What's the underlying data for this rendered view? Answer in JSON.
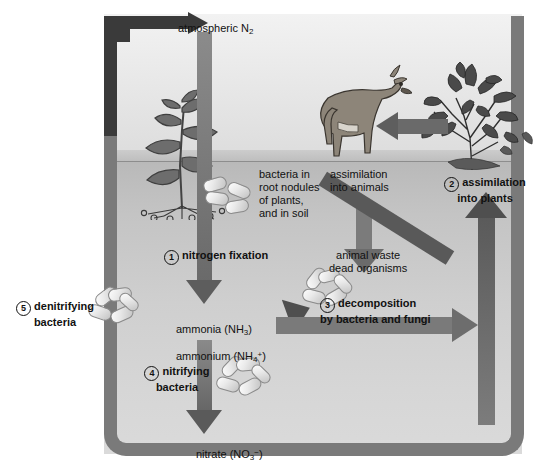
{
  "diagram": {
    "colors": {
      "loop_arrow": "#7a7a7a",
      "top_arrow": "#3a3a3a",
      "sky": "#e8e8e8",
      "soil": "#c9c9c9",
      "text": "#111111"
    }
  },
  "labels": {
    "atmospheric_n2": "atmospheric N",
    "atmospheric_n2_sub": "2",
    "bacteria_root_nodules": "bacteria in\nroot nodules\nof plants,\nand in soil",
    "assimilation_into_animals": "assimilation\ninto animals",
    "assimilation_into_plants": "assimilation\ninto plants",
    "assimilation_into_plants_num": "2",
    "nitrogen_fixation": "nitrogen fixation",
    "nitrogen_fixation_num": "1",
    "animal_waste_dead_organisms": "animal waste\ndead organisms",
    "denitrifying_bacteria": "denitrifying\nbacteria",
    "denitrifying_bacteria_num": "5",
    "ammonia": "ammonia (NH",
    "ammonia_sub": "3",
    "ammonia_close": ")",
    "ammonium": "ammonium (NH",
    "ammonium_sub": "4",
    "ammonium_sup": "+",
    "ammonium_close": ")",
    "decomposition": "decomposition\nby bacteria and fungi",
    "decomposition_num": "3",
    "nitrifying_bacteria": "nitrifying\nbacteria",
    "nitrifying_bacteria_num": "4",
    "nitrate": "nitrate (NO",
    "nitrate_sub": "3",
    "nitrate_sup": "−",
    "nitrate_close": ")"
  },
  "icons": {
    "legume_plant": "legume-plant-with-root-nodules-icon",
    "deer": "deer-icon",
    "shrub": "shrub-tree-icon",
    "bacteria_soil": "bacteria-capsules-icon",
    "bacteria_denitrifying": "bacteria-capsules-icon",
    "bacteria_decomposer": "bacteria-capsules-icon",
    "bacteria_nitrifying": "bacteria-capsules-icon"
  },
  "arrows": {
    "atmospheric_loop": "elbow-arrow-to-atmosphere",
    "nitrogen_fixation_arrow": "down-arrow-to-ammonia",
    "assimilation_animals_arrow": "down-arrow-to-animal-waste",
    "feeding_arrow": "left-arrow-tree-to-deer",
    "assimilation_plants_arrow": "up-arrow-to-plants",
    "decomposition_diagonal_arrow": "down-left-arrow-to-ammonia",
    "decomposition_horizontal_arrow": "right-arrow-to-plant-uptake",
    "nitrifying_arrow": "down-arrow-to-nitrate",
    "denitrifying_loop_arrow": "loop-arrow-nitrate-to-atmosphere"
  }
}
